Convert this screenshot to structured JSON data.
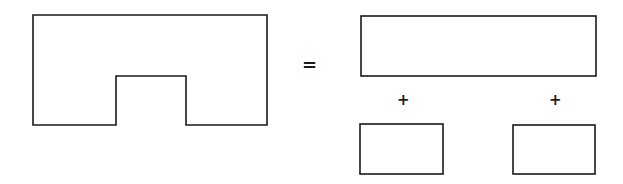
{
  "diagram": {
    "symbols": {
      "equals": "=",
      "plus_left": "+",
      "plus_right": "+"
    },
    "shapes": {
      "notched_shape": {
        "outer": [
          33,
          15,
          267,
          125
        ],
        "notch": [
          116,
          76,
          186,
          125
        ]
      },
      "top_rectangle": [
        361,
        16,
        596,
        76
      ],
      "bottom_left_rectangle": [
        360,
        124,
        443,
        174
      ],
      "bottom_right_rectangle": [
        513,
        125,
        595,
        174
      ]
    },
    "colors": {
      "stroke": "#1a1a1a",
      "background": "#ffffff"
    }
  }
}
